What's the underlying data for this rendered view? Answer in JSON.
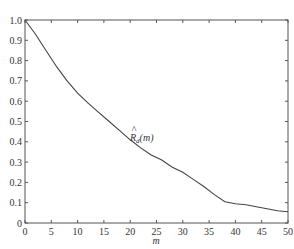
{
  "chart_data": {
    "type": "line",
    "title": "",
    "xlabel": "m",
    "ylabel": "",
    "xlim": [
      0,
      50
    ],
    "ylim": [
      0,
      1.0
    ],
    "grid": false,
    "legend": null,
    "x_ticks": [
      "0",
      "5",
      "10",
      "15",
      "20",
      "25",
      "30",
      "35",
      "40",
      "45",
      "50"
    ],
    "y_ticks": [
      "0",
      "0.1",
      "0.2",
      "0.3",
      "0.4",
      "0.5",
      "0.6",
      "0.7",
      "0.8",
      "0.9",
      "1.0"
    ],
    "annotations": [
      {
        "text": "R̂",
        "sub": "d",
        "suffix": "(m)",
        "x": 20,
        "y": 0.43
      }
    ],
    "series": [
      {
        "name": "R̂d(m)",
        "x": [
          0,
          2,
          4,
          6,
          8,
          10,
          12,
          14,
          16,
          18,
          20,
          22,
          24,
          26,
          28,
          30,
          32,
          34,
          36,
          38,
          40,
          42,
          44,
          46,
          48,
          50
        ],
        "values": [
          1.0,
          0.93,
          0.85,
          0.77,
          0.7,
          0.64,
          0.59,
          0.545,
          0.5,
          0.455,
          0.41,
          0.37,
          0.335,
          0.31,
          0.275,
          0.25,
          0.215,
          0.18,
          0.14,
          0.105,
          0.095,
          0.09,
          0.08,
          0.07,
          0.06,
          0.055
        ]
      }
    ]
  },
  "axes": {
    "xlabel": "m"
  },
  "annotation": {
    "main": "R",
    "hat": "^",
    "sub": "d",
    "suffix": "(m)"
  }
}
